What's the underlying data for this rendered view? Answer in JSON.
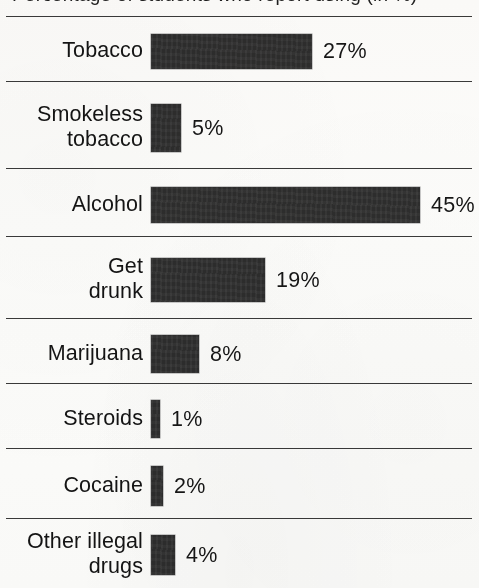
{
  "title": {
    "text": "Percentage of students who report using (in %)",
    "clipped": true
  },
  "chart_data": {
    "type": "bar",
    "orientation": "horizontal",
    "title": "Percentage of students who report using (in %)",
    "xlabel": "",
    "ylabel": "",
    "xlim": [
      0,
      50
    ],
    "grid": false,
    "legend": null,
    "value_suffix": "%",
    "categories": [
      "Tobacco",
      "Smokeless\ntobacco",
      "Alcohol",
      "Get\ndrunk",
      "Marijuana",
      "Steroids",
      "Cocaine",
      "Other illegal\ndrugs"
    ],
    "values": [
      27,
      5,
      45,
      19,
      8,
      1,
      2,
      4
    ],
    "value_labels": [
      "27%",
      "5%",
      "45%",
      "19%",
      "8%",
      "1%",
      "2%",
      "4%"
    ],
    "bar_color": "#2d2d2d",
    "background_color": "#fdfdfc",
    "rule_color": "#3a3a3a"
  },
  "rows": [
    {
      "label": "Tobacco",
      "value_label": "27%",
      "value": 27
    },
    {
      "label": "Smokeless\ntobacco",
      "value_label": "5%",
      "value": 5
    },
    {
      "label": "Alcohol",
      "value_label": "45%",
      "value": 45
    },
    {
      "label": "Get\ndrunk",
      "value_label": "19%",
      "value": 19
    },
    {
      "label": "Marijuana",
      "value_label": "8%",
      "value": 8
    },
    {
      "label": "Steroids",
      "value_label": "1%",
      "value": 1
    },
    {
      "label": "Cocaine",
      "value_label": "2%",
      "value": 2
    },
    {
      "label": "Other illegal\ndrugs",
      "value_label": "4%",
      "value": 4
    }
  ]
}
